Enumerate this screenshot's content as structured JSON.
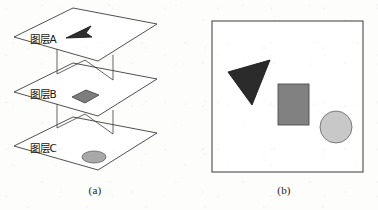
{
  "figure": {
    "background_color": "#fdfdfc",
    "stroke_color": "#3c3c3c",
    "panels": [
      {
        "id": "a",
        "caption": "(a)",
        "description": "exploded stacked map layers"
      },
      {
        "id": "b",
        "caption": "(b)",
        "description": "composited overlay result"
      }
    ]
  },
  "panel_a": {
    "caption": "(a)",
    "layers": [
      {
        "label": "图层A",
        "feature": "triangle",
        "feature_color": "#2e2e2e",
        "feature_outline": "#1a1a1a"
      },
      {
        "label": "图层B",
        "feature": "square",
        "feature_color": "#7d7d7d",
        "feature_outline": "#4a4a4a"
      },
      {
        "label": "图层C",
        "feature": "circle",
        "feature_color": "#a8a8a8",
        "feature_outline": "#6d6d6d"
      }
    ]
  },
  "panel_b": {
    "caption": "(b)",
    "frame_color": "#4a4a4a",
    "frame_fill": "#ffffff",
    "shapes": [
      {
        "name": "triangle",
        "fill": "#2b2b2b",
        "outline": "#1a1a1a"
      },
      {
        "name": "square",
        "fill": "#818181",
        "outline": "#4f4f4f"
      },
      {
        "name": "circle",
        "fill": "#c8c8c8",
        "outline": "#6f6f6f"
      }
    ]
  }
}
